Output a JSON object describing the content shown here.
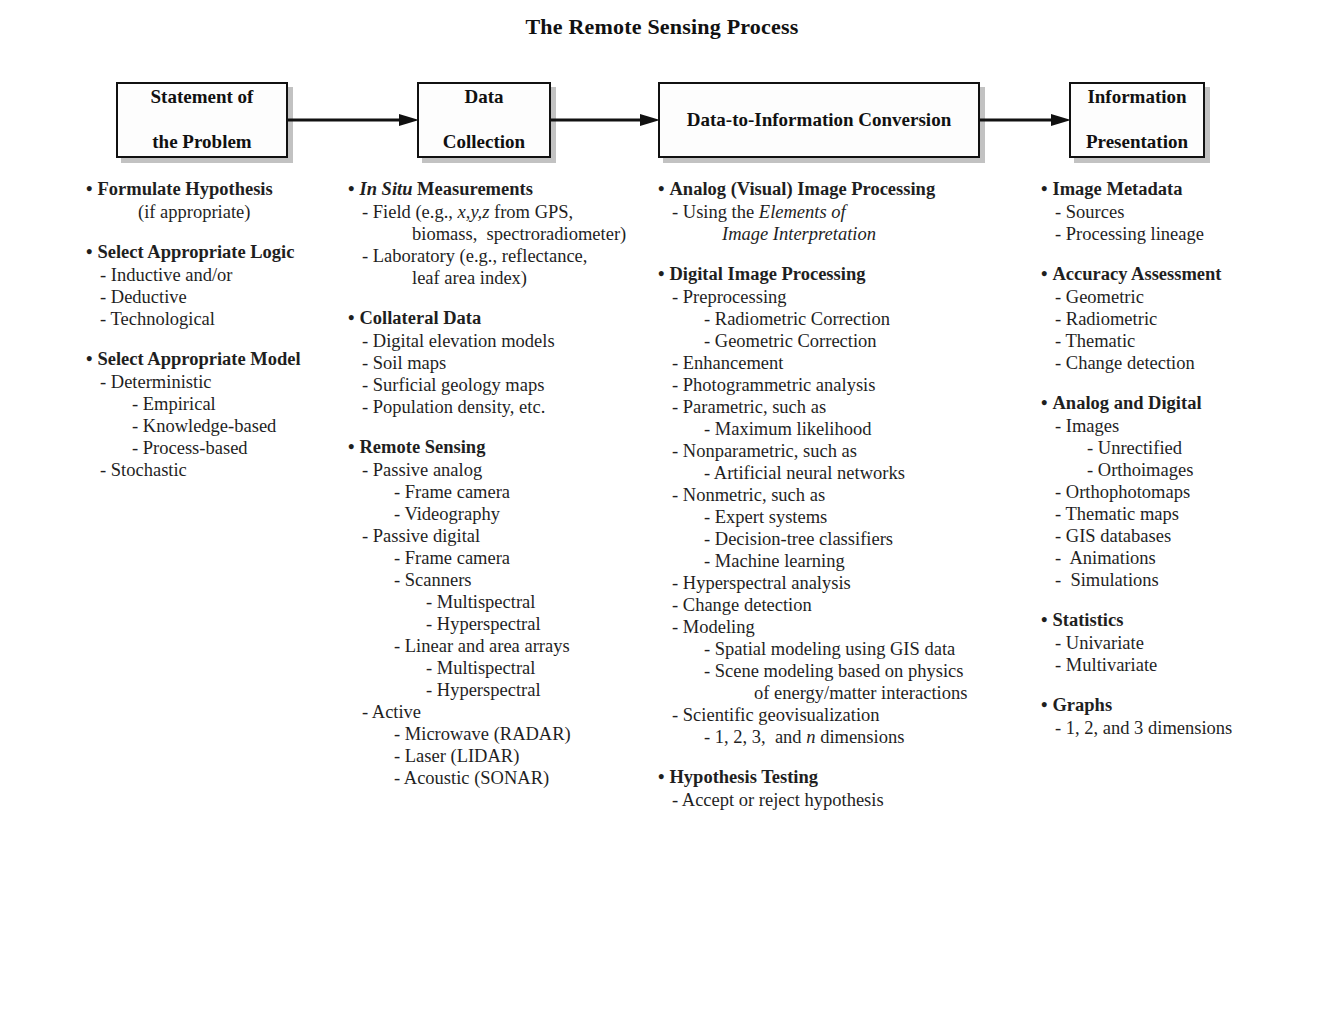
{
  "title": "The Remote Sensing Process",
  "flow": {
    "boxes": [
      {
        "id": "problem",
        "line1": "Statement of",
        "line2": "the Problem"
      },
      {
        "id": "collection",
        "line1": "Data",
        "line2": "Collection"
      },
      {
        "id": "conversion",
        "line1": "Data-to-Information Conversion",
        "line2": ""
      },
      {
        "id": "presentation",
        "line1": "Information",
        "line2": "Presentation"
      }
    ],
    "arrow_count": 3,
    "arrow_color": "#111111"
  },
  "columns": [
    {
      "id": "col-1",
      "groups": [
        {
          "header": "Formulate Hypothesis",
          "items": [
            {
              "text": "(if appropriate)",
              "level": "center"
            }
          ]
        },
        {
          "header": "Select Appropriate Logic",
          "items": [
            {
              "text": "- Inductive and/or",
              "level": 1
            },
            {
              "text": "- Deductive",
              "level": 1
            },
            {
              "text": "- Technological",
              "level": 1
            }
          ]
        },
        {
          "header": "Select Appropriate Model",
          "items": [
            {
              "text": "- Deterministic",
              "level": 1
            },
            {
              "text": "- Empirical",
              "level": 2
            },
            {
              "text": "- Knowledge-based",
              "level": 2
            },
            {
              "text": "- Process-based",
              "level": 2
            },
            {
              "text": "- Stochastic",
              "level": 1
            }
          ]
        }
      ]
    },
    {
      "id": "col-2",
      "groups": [
        {
          "header_italic": "In Situ",
          "header_rest": " Measurements",
          "items": [
            {
              "text": "- Field (e.g., ",
              "italic": "x,y,z",
              "text_after": " from GPS,",
              "level": 1,
              "rich": true
            },
            {
              "text": "biomass,  spectroradiometer)",
              "level": "cont2"
            },
            {
              "text": "- Laboratory (e.g., reflectance,",
              "level": 1
            },
            {
              "text": "leaf area index)",
              "level": "cont2"
            }
          ]
        },
        {
          "header": "Collateral Data",
          "items": [
            {
              "text": "- Digital elevation models",
              "level": 1
            },
            {
              "text": "- Soil maps",
              "level": 1
            },
            {
              "text": "- Surficial geology maps",
              "level": 1
            },
            {
              "text": "- Population density, etc.",
              "level": 1
            }
          ]
        },
        {
          "header": "Remote Sensing",
          "items": [
            {
              "text": "- Passive analog",
              "level": 1
            },
            {
              "text": "- Frame camera",
              "level": 2
            },
            {
              "text": "- Videography",
              "level": 2
            },
            {
              "text": "- Passive digital",
              "level": 1
            },
            {
              "text": "- Frame camera",
              "level": 2
            },
            {
              "text": "- Scanners",
              "level": 2
            },
            {
              "text": "- Multispectral",
              "level": 3
            },
            {
              "text": "- Hyperspectral",
              "level": 3
            },
            {
              "text": "- Linear and area arrays",
              "level": 2
            },
            {
              "text": "- Multispectral",
              "level": 3
            },
            {
              "text": "- Hyperspectral",
              "level": 3
            },
            {
              "text": "- Active",
              "level": 1
            },
            {
              "text": "- Microwave (RADAR)",
              "level": 2
            },
            {
              "text": "- Laser (LIDAR)",
              "level": 2
            },
            {
              "text": "- Acoustic (SONAR)",
              "level": 2
            }
          ]
        }
      ]
    },
    {
      "id": "col-3",
      "groups": [
        {
          "header": "Analog (Visual) Image Processing",
          "items": [
            {
              "text": "- Using the ",
              "italic": "Elements of",
              "level": 1,
              "rich": true
            },
            {
              "italic_only": "Image Interpretation",
              "level": "cont2"
            }
          ]
        },
        {
          "header": "Digital Image Processing",
          "items": [
            {
              "text": "- Preprocessing",
              "level": 1
            },
            {
              "text": "- Radiometric Correction",
              "level": 2
            },
            {
              "text": "- Geometric Correction",
              "level": 2
            },
            {
              "text": "- Enhancement",
              "level": 1
            },
            {
              "text": "- Photogrammetric analysis",
              "level": 1
            },
            {
              "text": "- Parametric, such as",
              "level": 1
            },
            {
              "text": "- Maximum likelihood",
              "level": 2
            },
            {
              "text": "- Nonparametric, such as",
              "level": 1
            },
            {
              "text": "- Artificial neural networks",
              "level": 2
            },
            {
              "text": "- Nonmetric, such as",
              "level": 1
            },
            {
              "text": "- Expert systems",
              "level": 2
            },
            {
              "text": "- Decision-tree classifiers",
              "level": 2
            },
            {
              "text": "- Machine learning",
              "level": 2
            },
            {
              "text": "- Hyperspectral analysis",
              "level": 1
            },
            {
              "text": "- Change detection",
              "level": 1
            },
            {
              "text": "- Modeling",
              "level": 1
            },
            {
              "text": "- Spatial modeling using GIS data",
              "level": 2
            },
            {
              "text": "- Scene modeling based on physics",
              "level": 2
            },
            {
              "text": "of energy/matter interactions",
              "level": "cont3"
            },
            {
              "text": "- Scientific geovisualization",
              "level": 1
            },
            {
              "text": "- 1, 2, 3,  and ",
              "italic": "n",
              "text_after": " dimensions",
              "level": 2,
              "rich": true
            }
          ]
        },
        {
          "header": "Hypothesis Testing",
          "items": [
            {
              "text": "- Accept or reject hypothesis",
              "level": 1
            }
          ]
        }
      ]
    },
    {
      "id": "col-4",
      "groups": [
        {
          "header": "Image Metadata",
          "items": [
            {
              "text": "- Sources",
              "level": 1
            },
            {
              "text": "- Processing lineage",
              "level": 1
            }
          ]
        },
        {
          "header": "Accuracy Assessment",
          "items": [
            {
              "text": "- Geometric",
              "level": 1
            },
            {
              "text": "- Radiometric",
              "level": 1
            },
            {
              "text": "- Thematic",
              "level": 1
            },
            {
              "text": "- Change detection",
              "level": 1
            }
          ]
        },
        {
          "header": "Analog and Digital",
          "items": [
            {
              "text": "- Images",
              "level": 1
            },
            {
              "text": "- Unrectified",
              "level": 2
            },
            {
              "text": "- Orthoimages",
              "level": 2
            },
            {
              "text": "- Orthophotomaps",
              "level": 1
            },
            {
              "text": "- Thematic maps",
              "level": 1
            },
            {
              "text": "- GIS databases",
              "level": 1
            },
            {
              "text": "-  Animations",
              "level": 1
            },
            {
              "text": "-  Simulations",
              "level": 1
            }
          ]
        },
        {
          "header": "Statistics",
          "items": [
            {
              "text": "- Univariate",
              "level": 1
            },
            {
              "text": "- Multivariate",
              "level": 1
            }
          ]
        },
        {
          "header": "Graphs",
          "items": [
            {
              "text": "- 1, 2, and 3 dimensions",
              "level": 1
            }
          ]
        }
      ]
    }
  ],
  "bullet_glyph": "•",
  "caption": ""
}
